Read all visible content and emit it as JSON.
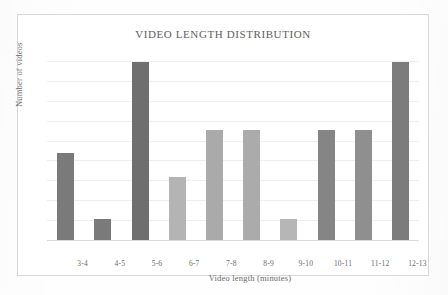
{
  "chart_data": {
    "type": "bar",
    "title": "VIDEO LENGTH DISTRIBUTION",
    "xlabel": "Video length (minutes)",
    "ylabel": "Number of videos",
    "categories": [
      "3-4",
      "4-5",
      "5-6",
      "6-7",
      "7-8",
      "8-9",
      "9-10",
      "10-11",
      "11-12",
      "12-13"
    ],
    "values": [
      4.4,
      1.1,
      9.0,
      3.2,
      5.6,
      5.6,
      1.1,
      5.6,
      5.6,
      9.0
    ],
    "bar_colors": [
      "#7a7a7a",
      "#7a7a7a",
      "#6f6f6f",
      "#b4b4b4",
      "#aaaaaa",
      "#ababab",
      "#b6b6b6",
      "#858585",
      "#8f8f8f",
      "#7c7c7c"
    ],
    "ylim": [
      0,
      10
    ],
    "gridlines": [
      1,
      2,
      3,
      4,
      5,
      6,
      7,
      8,
      9
    ],
    "grid": true,
    "y_tick_labels_visible": false,
    "legend": null,
    "legend_position": "none"
  },
  "colors": {
    "frame_border": "#d8d8d8",
    "gridline": "#eeeeee",
    "axis": "#dadada",
    "text": "#6a6a6a",
    "title_text": "#5e5e5e",
    "background": "#ffffff"
  }
}
